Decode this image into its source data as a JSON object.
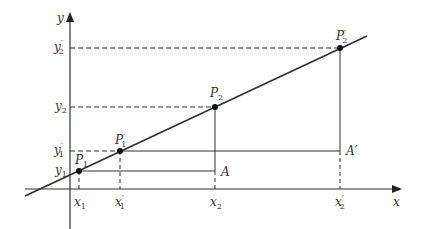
{
  "axes": {
    "x_label": "x",
    "y_label": "y"
  },
  "points": [
    {
      "name": "P",
      "sub": "1",
      "prime": "",
      "cx": 79,
      "cy": 171
    },
    {
      "name": "P",
      "sub": "1",
      "prime": "′",
      "cx": 120,
      "cy": 151
    },
    {
      "name": "P",
      "sub": "2",
      "prime": "",
      "cx": 215,
      "cy": 107
    },
    {
      "name": "P",
      "sub": "2",
      "prime": "′",
      "cx": 340,
      "cy": 48
    }
  ],
  "x_ticks": [
    {
      "name": "x",
      "sub": "1",
      "prime": ""
    },
    {
      "name": "x",
      "sub": "1",
      "prime": "′"
    },
    {
      "name": "x",
      "sub": "2",
      "prime": ""
    },
    {
      "name": "x",
      "sub": "2",
      "prime": "′"
    }
  ],
  "y_ticks": [
    {
      "name": "y",
      "sub": "2",
      "prime": "′"
    },
    {
      "name": "y",
      "sub": "2",
      "prime": ""
    },
    {
      "name": "y",
      "sub": "1",
      "prime": "′"
    },
    {
      "name": "y",
      "sub": "1",
      "prime": ""
    }
  ],
  "corner_labels": {
    "A": "A",
    "A_prime": "A′"
  },
  "colors": {
    "line": "#333333",
    "background": "#ffffff"
  }
}
